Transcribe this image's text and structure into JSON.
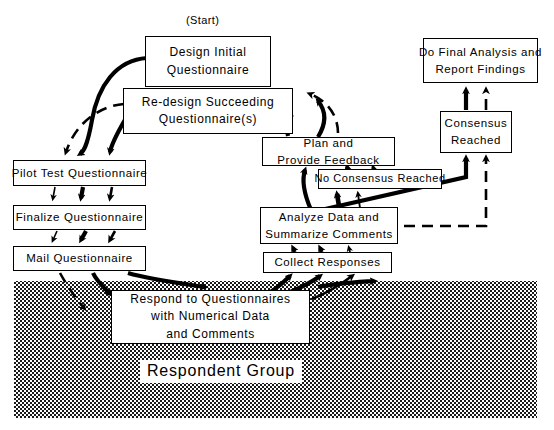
{
  "diagram": {
    "start_label": "(Start)",
    "region_label": "Respondent Group",
    "colors": {
      "stroke": "#000000",
      "box_fill": "#ffffff",
      "page_background": "#ffffff",
      "shaded_region": "#a8a8a8"
    },
    "nodes": [
      {
        "id": "design-initial-questionnaire",
        "lines": [
          "Design  Initial",
          "Questionnaire"
        ],
        "x": 145,
        "y": 36,
        "w": 126,
        "h": 51,
        "font": "f12"
      },
      {
        "id": "re-design-succeeding-questionnaires",
        "lines": [
          "Re-design Succeeding",
          "Questionnaire(s)"
        ],
        "x": 123,
        "y": 88,
        "w": 170,
        "h": 46,
        "font": "f12"
      },
      {
        "id": "pilot-test-questionnaire",
        "lines": [
          "Pilot Test Questionnaire"
        ],
        "x": 13,
        "y": 160,
        "w": 133,
        "h": 26,
        "font": "f115"
      },
      {
        "id": "finalize-questionnaire",
        "lines": [
          "Finalize Questionnaire"
        ],
        "x": 13,
        "y": 205,
        "w": 133,
        "h": 25,
        "font": "f115"
      },
      {
        "id": "mail-questionnaire",
        "lines": [
          "Mail Questionnaire"
        ],
        "x": 13,
        "y": 246,
        "w": 133,
        "h": 25,
        "font": "f115"
      },
      {
        "id": "respond-to-questionnaires",
        "lines": [
          "Respond to Questionnaires",
          "with Numerical Data",
          "and Comments"
        ],
        "x": 111,
        "y": 290,
        "w": 199,
        "h": 54,
        "font": "f12"
      },
      {
        "id": "collect-responses",
        "lines": [
          "Collect Responses"
        ],
        "x": 263,
        "y": 252,
        "w": 129,
        "h": 21,
        "font": "f115"
      },
      {
        "id": "analyze-data-summarize-comments",
        "lines": [
          "Analyze Data and",
          "Summarize Comments"
        ],
        "x": 260,
        "y": 207,
        "w": 138,
        "h": 37,
        "font": "f115"
      },
      {
        "id": "no-consensus-reached",
        "lines": [
          "No Consensus Reached"
        ],
        "x": 318,
        "y": 169,
        "w": 124,
        "h": 20,
        "font": "f11"
      },
      {
        "id": "plan-and-provide-feedback",
        "lines": [
          "Plan and",
          "Provide Feedback"
        ],
        "x": 262,
        "y": 137,
        "w": 133,
        "h": 29,
        "font": "f115"
      },
      {
        "id": "consensus-reached",
        "lines": [
          "Consensus",
          "Reached"
        ],
        "x": 440,
        "y": 111,
        "w": 72,
        "h": 42,
        "font": "f115"
      },
      {
        "id": "do-final-analysis-report-findings",
        "lines": [
          "Do Final Analysis and",
          "Report Findings"
        ],
        "x": 423,
        "y": 38,
        "w": 115,
        "h": 45,
        "font": "f115"
      }
    ],
    "region": {
      "x": 14,
      "y": 281,
      "w": 523,
      "h": 137
    },
    "start_label_pos": {
      "x": 186,
      "y": 14
    },
    "region_label_pos": {
      "x": 140,
      "y": 360
    }
  }
}
